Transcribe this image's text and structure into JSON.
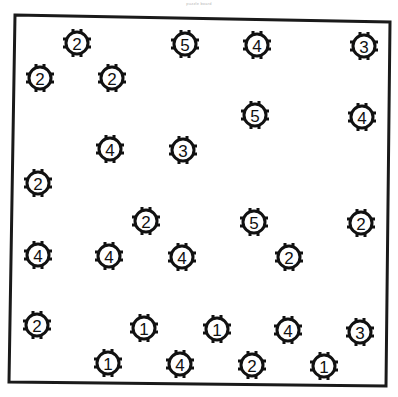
{
  "title": "puzzle board",
  "frame": {
    "color": "#1a1a1a",
    "corners": [
      [
        15,
        15
      ],
      [
        390,
        22
      ],
      [
        386,
        386
      ],
      [
        9,
        382
      ]
    ]
  },
  "marker_style": {
    "ring_color": "#111111",
    "ring_radius": 11,
    "ring_stroke": 3,
    "fill": "#ffffff"
  },
  "markers": [
    {
      "label": "2",
      "x": 77,
      "y": 43
    },
    {
      "label": "5",
      "x": 185,
      "y": 44
    },
    {
      "label": "4",
      "x": 257,
      "y": 45
    },
    {
      "label": "3",
      "x": 364,
      "y": 46
    },
    {
      "label": "2",
      "x": 40,
      "y": 78
    },
    {
      "label": "2",
      "x": 112,
      "y": 78
    },
    {
      "label": "5",
      "x": 255,
      "y": 115
    },
    {
      "label": "4",
      "x": 362,
      "y": 117
    },
    {
      "label": "4",
      "x": 110,
      "y": 149
    },
    {
      "label": "3",
      "x": 183,
      "y": 150
    },
    {
      "label": "2",
      "x": 38,
      "y": 183
    },
    {
      "label": "2",
      "x": 146,
      "y": 221
    },
    {
      "label": "5",
      "x": 254,
      "y": 222
    },
    {
      "label": "2",
      "x": 361,
      "y": 223
    },
    {
      "label": "4",
      "x": 38,
      "y": 255
    },
    {
      "label": "4",
      "x": 109,
      "y": 256
    },
    {
      "label": "4",
      "x": 182,
      "y": 257
    },
    {
      "label": "2",
      "x": 289,
      "y": 257
    },
    {
      "label": "2",
      "x": 37,
      "y": 325
    },
    {
      "label": "1",
      "x": 144,
      "y": 328
    },
    {
      "label": "1",
      "x": 217,
      "y": 329
    },
    {
      "label": "4",
      "x": 288,
      "y": 330
    },
    {
      "label": "3",
      "x": 360,
      "y": 332
    },
    {
      "label": "1",
      "x": 108,
      "y": 363
    },
    {
      "label": "4",
      "x": 180,
      "y": 364
    },
    {
      "label": "2",
      "x": 252,
      "y": 365
    },
    {
      "label": "1",
      "x": 324,
      "y": 366
    }
  ]
}
